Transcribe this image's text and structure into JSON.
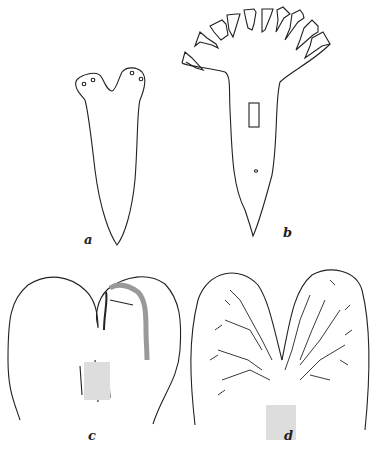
{
  "figure": {
    "panels": [
      {
        "id": "a",
        "label": "a",
        "description": "flatworm outline with two-lobed head and eyespots"
      },
      {
        "id": "b",
        "label": "b",
        "description": "flatworm with fan of regenerated head lobes, pharynx and pore"
      },
      {
        "id": "c",
        "label": "c",
        "description": "anterior end with lateral outgrowth and pharynx"
      },
      {
        "id": "d",
        "label": "d",
        "description": "bifurcated anterior end showing branched gut"
      }
    ],
    "colors": {
      "line": "#222222",
      "background": "#ffffff",
      "stipple": "#bbbbbb"
    }
  }
}
